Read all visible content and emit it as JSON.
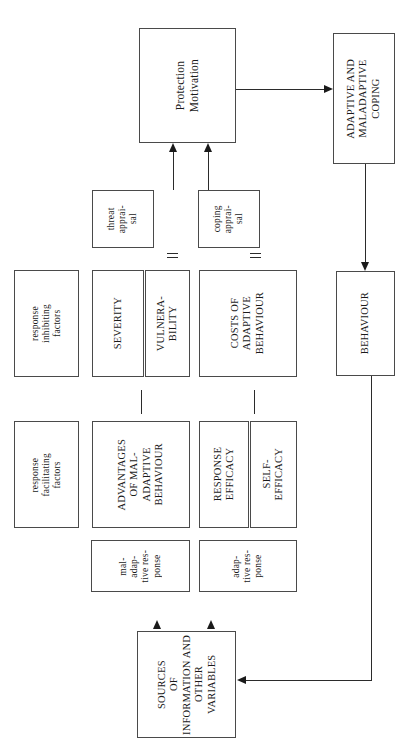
{
  "diagram": {
    "orientation": "rotated-90-clockwise",
    "line_color": "#2b2b2b",
    "box_border_color": "#4a4a4a",
    "background": "#ffffff",
    "nodes": {
      "protection_motivation": "Protection\nMotivation",
      "adaptive_maladaptive_coping": "ADAPTIVE AND\nMALADAPTIVE\nCOPING",
      "behaviour": "BEHAVIOUR",
      "threat_appraisal": "threat\napprai-\nsal",
      "coping_appraisal": "coping\napprai-\nsal",
      "response_inhibiting_factors": "response\ninhibiting\nfactors",
      "response_facilitating_factors": "response\nfacilitating\nfactors",
      "severity": "SEVERITY",
      "vulnerability": "VULNERA-\nBILITY",
      "costs_of_adaptive_behaviour": "COSTS OF\nADAPTIVE\nBEHAVIOUR",
      "advantages_of_maladaptive_behaviour": "ADVANTAGES\nOF MAL-\nADAPTIVE\nBEHAVIOUR",
      "response_efficacy": "RESPONSE\nEFFICACY",
      "self_efficacy": "SELF-\nEFFICACY",
      "maladaptive_response": "mal-\nadap-\ntive    res-\nponse",
      "adaptive_response": "adap-\ntive    res-\nponse",
      "sources_of_information": "SOURCES\nOF\nINFORMATION AND OTHER\nVARIABLES"
    }
  }
}
